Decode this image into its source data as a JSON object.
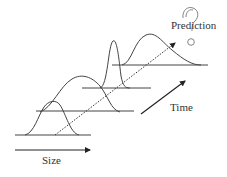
{
  "diagram": {
    "labels": {
      "size": "Size",
      "time": "Time",
      "prediction": "Prediction"
    },
    "icons": {
      "prediction_icon": "question-mark-icon"
    },
    "colors": {
      "stroke": "#333333",
      "background": "#ffffff"
    },
    "distributions": [
      {
        "name": "t1",
        "shape": "narrow-bell",
        "baseline_y": 135
      },
      {
        "name": "t2",
        "shape": "wide-bell",
        "baseline_y": 111
      },
      {
        "name": "t3",
        "shape": "tall-narrow-bell",
        "baseline_y": 88
      },
      {
        "name": "t4",
        "shape": "right-skewed-bell",
        "baseline_y": 65
      }
    ],
    "arrows": {
      "size_axis": "solid arrow pointing right",
      "time_axis": "solid arrow pointing up-right",
      "trend": "dotted arrow pointing toward prediction"
    }
  }
}
